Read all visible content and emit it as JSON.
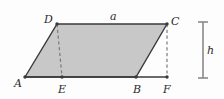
{
  "figure": {
    "kind": "geometry-diagram",
    "background_color": "#fdfdfd",
    "fill_color": "#c8c8c8",
    "stroke_color": "#3a3a3a",
    "dash_color": "#7a7a7a",
    "measure_color": "#8a8a8a",
    "vertices": [
      {
        "id": "A",
        "label": "A",
        "x": 25,
        "y": 77,
        "label_x": 14,
        "label_y": 78
      },
      {
        "id": "B",
        "label": "B",
        "x": 136,
        "y": 77,
        "label_x": 133,
        "label_y": 84
      },
      {
        "id": "C",
        "label": "C",
        "x": 167,
        "y": 24,
        "label_x": 171,
        "label_y": 16
      },
      {
        "id": "D",
        "label": "D",
        "x": 57,
        "y": 24,
        "label_x": 44,
        "label_y": 14
      },
      {
        "id": "E",
        "label": "E",
        "x": 62,
        "y": 77,
        "label_x": 58,
        "label_y": 84
      },
      {
        "id": "F",
        "label": "F",
        "x": 167,
        "y": 77,
        "label_x": 163,
        "label_y": 84
      }
    ],
    "polygon": {
      "name": "parallelogram-ABCD",
      "points": "25,77 57,24 167,24 136,77"
    },
    "baseline": {
      "name": "baseline-AF",
      "x1": 25,
      "y1": 77,
      "x2": 167,
      "y2": 77
    },
    "altitudes": [
      {
        "name": "altitude-DE",
        "x1": 57,
        "y1": 24,
        "x2": 62,
        "y2": 77
      },
      {
        "name": "altitude-CF",
        "x1": 167,
        "y1": 24,
        "x2": 167,
        "y2": 77
      }
    ],
    "side_labels": [
      {
        "id": "a",
        "label": "a",
        "x": 110,
        "y": 11
      }
    ],
    "measure": {
      "id": "h",
      "label": "h",
      "label_x": 207,
      "label_y": 45,
      "bar_x": 203,
      "bar_top": 22,
      "bar_bottom": 78,
      "cap_half_width": 5
    }
  }
}
